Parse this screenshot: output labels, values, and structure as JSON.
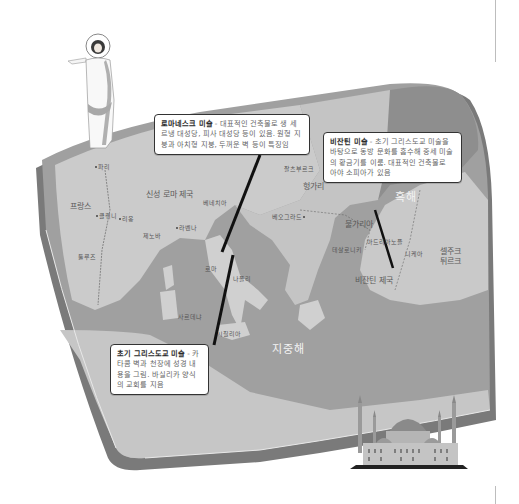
{
  "callouts": {
    "romanesque": {
      "title": "로마네스크 미술",
      "separator": " - ",
      "body": "대표적인 건축물로 생 세르냉 대성당, 피사 대성당 등이 있음. 원형 지붕과 아치형 지붕, 두꺼운 벽 등이 특징임"
    },
    "byzantine": {
      "title": "비잔틴 미술",
      "separator": " - ",
      "body": "초기 그리스도교 미술을 바탕으로 동방 문화를 흡수해 중세 미술의 황금기를 이룸. 대표적인 건축물로 아야 소피아가 있음"
    },
    "early_christian": {
      "title": "초기 그리스도교 미술",
      "separator": " - ",
      "body": "카타콤 벽과 천장에 성경 내용을 그림. 바실리카 양식의 교회를 지음"
    }
  },
  "map": {
    "regions": [
      {
        "label": "신성 로마 제국"
      },
      {
        "label": "프랑스"
      },
      {
        "label": "헝가리"
      },
      {
        "label": "불가리아"
      },
      {
        "label": "비잔틴 제국"
      },
      {
        "label": "셀주크 튀르크"
      }
    ],
    "seas": [
      {
        "label": "흑해"
      },
      {
        "label": "지중해"
      }
    ],
    "cities": [
      {
        "label": "파리"
      },
      {
        "label": "클뤼니"
      },
      {
        "label": "리옹"
      },
      {
        "label": "툴루즈"
      },
      {
        "label": "제노바"
      },
      {
        "label": "라벤나"
      },
      {
        "label": "베네치아"
      },
      {
        "label": "로마"
      },
      {
        "label": "나폴리"
      },
      {
        "label": "베오그라드"
      },
      {
        "label": "테살로니키"
      },
      {
        "label": "아드리아노플"
      },
      {
        "label": "니케아"
      },
      {
        "label": "시칠리아"
      },
      {
        "label": "사르데냐"
      },
      {
        "label": "잘츠부르크"
      }
    ]
  },
  "illustrations": {
    "jesus": "jesus-figure",
    "hagia_sophia": "hagia-sophia"
  },
  "colors": {
    "land": "#c9c9c9",
    "sea": "#9a9a9a",
    "shadow": "#7a7a7a",
    "callout_border": "#333333"
  }
}
